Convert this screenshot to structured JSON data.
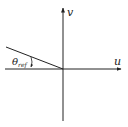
{
  "diagram": {
    "axes": {
      "horizontal_label": "u",
      "vertical_label": "v"
    },
    "angle": {
      "symbol": "θ",
      "subscript": "ref"
    },
    "colors": {
      "stroke": "#222222",
      "background": "#ffffff"
    }
  }
}
